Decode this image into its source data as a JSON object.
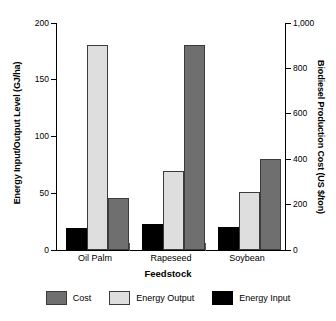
{
  "chart_data": {
    "type": "bar",
    "title": "",
    "xlabel": "Feedstock",
    "ylabel": "Energy Input/Output Level (GJ/ha)",
    "y2label": "Biodiesel Production Cost (US $/ton)",
    "categories": [
      "Oil Palm",
      "Rapeseed",
      "Soybean"
    ],
    "ylim": [
      0,
      200
    ],
    "y2lim": [
      0,
      1000
    ],
    "yticks": [
      "0",
      "50",
      "100",
      "150",
      "200"
    ],
    "ytick_values": [
      0,
      50,
      100,
      150,
      200
    ],
    "y2ticks": [
      "0",
      "200",
      "400",
      "600",
      "800",
      "1,000"
    ],
    "y2tick_values": [
      0,
      200,
      400,
      600,
      800,
      1000
    ],
    "grid": false,
    "legend_position": "bottom",
    "series": [
      {
        "name": "Energy Input",
        "axis": "left",
        "unit": "GJ/ha",
        "color": "#000000",
        "values": [
          19,
          23,
          20
        ]
      },
      {
        "name": "Energy Output",
        "axis": "left",
        "unit": "GJ/ha",
        "color": "#dedede",
        "values": [
          181,
          70,
          51
        ]
      },
      {
        "name": "Cost",
        "axis": "right",
        "unit": "US $/ton",
        "color": "#6f6f6f",
        "values": [
          230,
          905,
          400
        ]
      }
    ],
    "legend": [
      "Cost",
      "Energy Output",
      "Energy Input"
    ]
  },
  "colors": {
    "cost": "#6f6f6f",
    "energy_output": "#dedede",
    "energy_input": "#000000",
    "axis": "#000000",
    "background": "#ffffff"
  }
}
